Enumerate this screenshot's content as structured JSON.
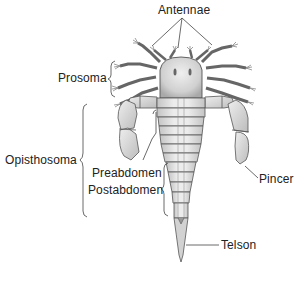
{
  "diagram": {
    "labels": {
      "antennae": "Antennae",
      "prosoma": "Prosoma",
      "opisthosoma": "Opisthosoma",
      "preabdomen": "Preabdomen",
      "postabdomen": "Postabdomen",
      "pincer": "Pincer",
      "telson": "Telson"
    },
    "colors": {
      "background": "#ffffff",
      "text": "#222222",
      "line": "#444444",
      "body_fill": "#e6e6e6",
      "body_shade": "#bdbdbd",
      "outline": "#555555"
    }
  }
}
